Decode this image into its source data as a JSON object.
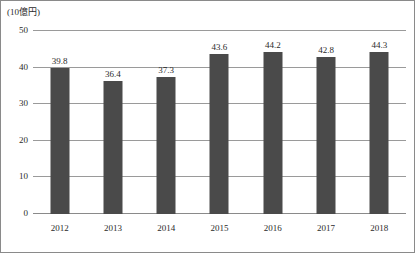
{
  "chart_data": {
    "type": "bar",
    "title": "",
    "subtitle": "",
    "unit_label": "(10億円)",
    "xlabel": "",
    "ylabel": "",
    "categories": [
      "2012",
      "2013",
      "2014",
      "2015",
      "2016",
      "2017",
      "2018"
    ],
    "values": [
      39.8,
      36.4,
      37.3,
      43.6,
      44.2,
      42.8,
      44.3
    ],
    "value_labels": [
      "39.8",
      "36.4",
      "37.3",
      "43.6",
      "44.2",
      "42.8",
      "44.3"
    ],
    "ylim": [
      0,
      50
    ],
    "yticks": [
      0,
      10,
      20,
      30,
      40,
      50
    ],
    "ytick_labels": [
      "0",
      "10",
      "20",
      "30",
      "40",
      "50"
    ],
    "grid": true,
    "grid_axis": "y",
    "legend": false,
    "legend_position": "none",
    "bar_color": "#4a4a4a",
    "grid_color": "#9a9a9a",
    "axis_color": "#8a8a8a",
    "text_color": "#2b2b2b",
    "background_color": "#ffffff"
  }
}
